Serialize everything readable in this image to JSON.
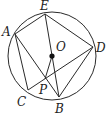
{
  "diagram": {
    "type": "geometry-circle",
    "circle": {
      "center": "O",
      "cx": 52,
      "cy": 56,
      "r": 44
    },
    "points": {
      "A": {
        "label": "A",
        "x": 15,
        "y": 34,
        "lx": 2,
        "ly": 36
      },
      "E": {
        "label": "E",
        "x": 45,
        "y": 14,
        "lx": 40,
        "ly": 10
      },
      "D": {
        "label": "D",
        "x": 93,
        "y": 47,
        "lx": 96,
        "ly": 52
      },
      "O": {
        "label": "O",
        "x": 52,
        "y": 56,
        "lx": 56,
        "ly": 51
      },
      "C": {
        "label": "C",
        "x": 28,
        "y": 90,
        "lx": 17,
        "ly": 106
      },
      "B": {
        "label": "B",
        "x": 59,
        "y": 97,
        "lx": 55,
        "ly": 113
      },
      "P": {
        "label": "P",
        "x": 45,
        "y": 79,
        "lx": 39,
        "ly": 94
      }
    },
    "segments": [
      "AE",
      "ED",
      "EB",
      "AC",
      "AB",
      "CD",
      "DB",
      "OP"
    ],
    "colors": {
      "stroke": "#2a2a2a",
      "background": "#ffffff"
    }
  }
}
